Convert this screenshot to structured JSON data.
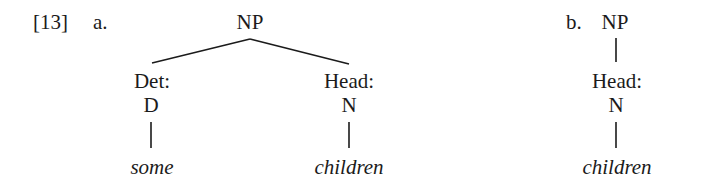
{
  "example_number": "[13]",
  "trees": [
    {
      "label": "a.",
      "root": "NP",
      "children": [
        {
          "function": "Det:",
          "category": "D",
          "word": "some"
        },
        {
          "function": "Head:",
          "category": "N",
          "word": "children"
        }
      ]
    },
    {
      "label": "b.",
      "root": "NP",
      "children": [
        {
          "function": "Head:",
          "category": "N",
          "word": "children"
        }
      ]
    }
  ],
  "colors": {
    "text": "#1b1b1b",
    "lines": "#1b1b1b",
    "background": "#ffffff"
  }
}
